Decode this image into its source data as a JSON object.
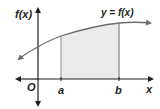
{
  "diagram": {
    "type": "area-under-curve",
    "y_axis_label": "f(x)",
    "x_axis_label": "x",
    "origin_label": "O",
    "curve_label": "y = f(x)",
    "bound_left_label": "a",
    "bound_right_label": "b",
    "colors": {
      "axis": "#231f20",
      "curve": "#6d6e71",
      "shade": "#ebebeb",
      "bound_lines": "#6d6e71"
    }
  }
}
